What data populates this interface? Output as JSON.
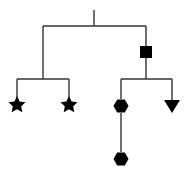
{
  "diagram": {
    "type": "tree",
    "line_color": "#333333",
    "node_color": "#000000",
    "root": {
      "stem": {
        "x": 94,
        "y1": 10,
        "y2": 26
      },
      "bar": {
        "y": 26,
        "x1": 43,
        "x2": 146
      }
    },
    "nodes": [
      {
        "id": "internal-square",
        "shape": "square",
        "cx": 146,
        "cy": 52,
        "size": 12
      },
      {
        "id": "leaf-star-left",
        "shape": "star",
        "cx": 17,
        "cy": 105,
        "r": 9
      },
      {
        "id": "leaf-star-right",
        "shape": "star",
        "cx": 69,
        "cy": 105,
        "r": 9
      },
      {
        "id": "hexagon-upper",
        "shape": "hexagon",
        "cx": 121,
        "cy": 106,
        "r": 7.5
      },
      {
        "id": "triangle-leaf",
        "shape": "triangle-down",
        "cx": 172,
        "cy": 106,
        "r": 8
      },
      {
        "id": "hexagon-lower",
        "shape": "hexagon",
        "cx": 121,
        "cy": 159,
        "r": 7.5
      }
    ]
  }
}
